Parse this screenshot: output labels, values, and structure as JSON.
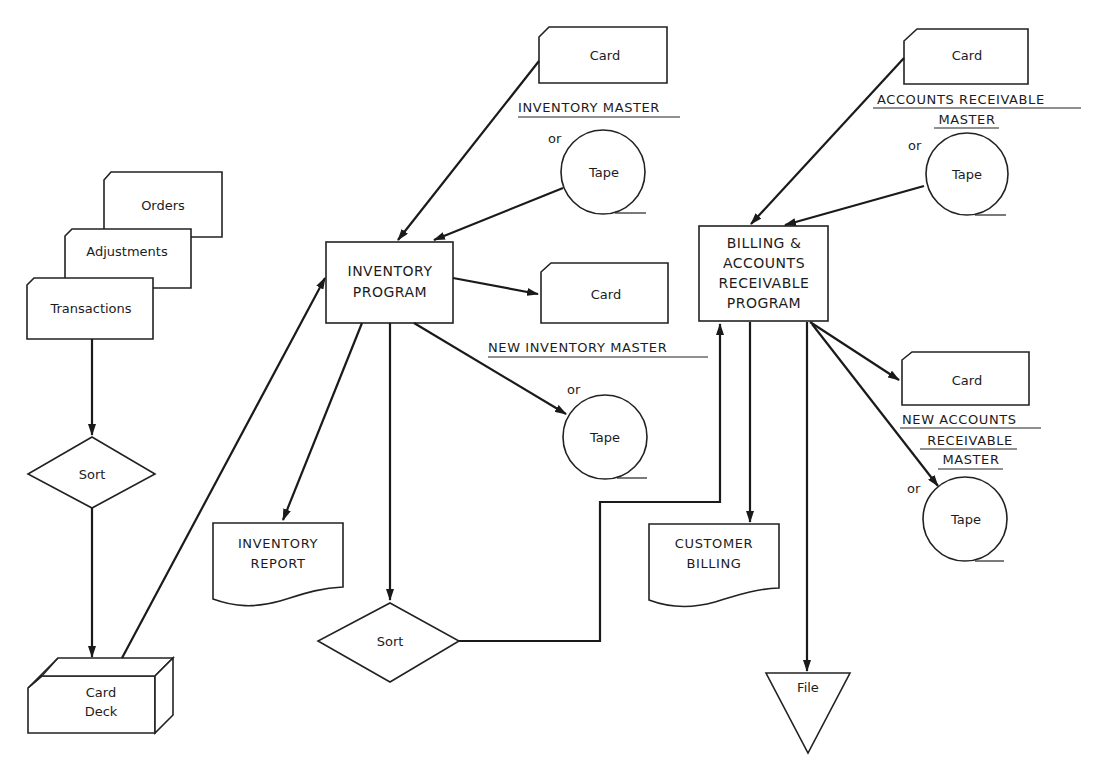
{
  "diagram": {
    "type": "system flowchart",
    "inputs": {
      "orders": "Orders",
      "adjustments": "Adjustments",
      "transactions": "Transactions"
    },
    "sort_1": "Sort",
    "card_deck": {
      "line1": "Card",
      "line2": "Deck"
    },
    "inventory_program": {
      "line1": "INVENTORY",
      "line2": "PROGRAM"
    },
    "inventory_master": {
      "card": "Card",
      "title": "INVENTORY MASTER",
      "or": "or",
      "tape": "Tape"
    },
    "new_inventory_master": {
      "card": "Card",
      "title": "NEW INVENTORY MASTER",
      "or": "or",
      "tape": "Tape"
    },
    "inventory_report": {
      "line1": "INVENTORY",
      "line2": "REPORT"
    },
    "sort_2": "Sort",
    "billing_program": {
      "line1": "BILLING &",
      "line2": "ACCOUNTS",
      "line3": "RECEIVABLE",
      "line4": "PROGRAM"
    },
    "ar_master": {
      "card": "Card",
      "title_line1": "ACCOUNTS RECEIVABLE",
      "title_line2": "MASTER",
      "or": "or",
      "tape": "Tape"
    },
    "new_ar_master": {
      "card": "Card",
      "title_line1": "NEW ACCOUNTS",
      "title_line2": "RECEIVABLE",
      "title_line3": "MASTER",
      "or": "or",
      "tape": "Tape"
    },
    "customer_billing": {
      "line1": "CUSTOMER",
      "line2": "BILLING"
    },
    "file": "File"
  }
}
